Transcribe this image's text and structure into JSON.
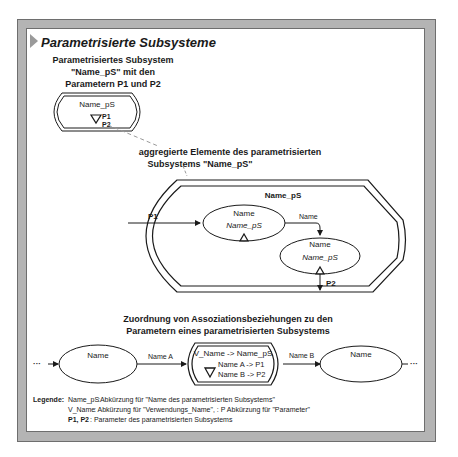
{
  "title": "Parametrisierte Subsysteme",
  "section1": {
    "heading_lines": [
      "Parametrisiertes Subsystem",
      "\"Name_pS\" mit den",
      "Parametern P1 und P2"
    ],
    "symbol": {
      "name": "Name_pS",
      "param1": "P1",
      "param2": "P2"
    }
  },
  "section2": {
    "heading_lines": [
      "aggregierte Elemente des parametrisierten",
      "Subsystems \"Name_pS\""
    ],
    "container_name": "Name_pS",
    "input_param": "P1",
    "output_param": "P2",
    "element1": {
      "name": "Name",
      "subname": "Name_pS"
    },
    "connection_label": "Name",
    "element2": {
      "name": "Name",
      "subname": "Name_pS"
    }
  },
  "section3": {
    "heading_lines": [
      "Zuordnung von Assoziationsbeziehungen zu den",
      "Parametern eines parametrisierten Subsystems"
    ],
    "left_ellipsis": "···",
    "left_element": "Name",
    "assoc_a": "Name A",
    "subsystem": {
      "line1": "V_Name -> Name_pS",
      "line2": "Name A -> P1",
      "line3": "Name B -> P2"
    },
    "assoc_b": "Name B",
    "right_element": "Name",
    "right_ellipsis": "···"
  },
  "legend": {
    "label": "Legende:",
    "lines": [
      {
        "key": "Name_pS",
        "text": ":Abkürzung für \"Name des parametrisierten Subsystems\""
      },
      {
        "key": "V_Name",
        "text": ": Abkürzung für \"Verwendungs_Name\",   :  P Abkürzung für \"Parameter\""
      },
      {
        "key": "P1, P2",
        "text": ":  Parameter des parametrisierten Subsystems"
      }
    ]
  },
  "colors": {
    "frame": "#b4b4b4",
    "frame_border": "#6e6e6e",
    "arrow_gray": "#9a9a9a",
    "line": "#1a1a1a"
  }
}
